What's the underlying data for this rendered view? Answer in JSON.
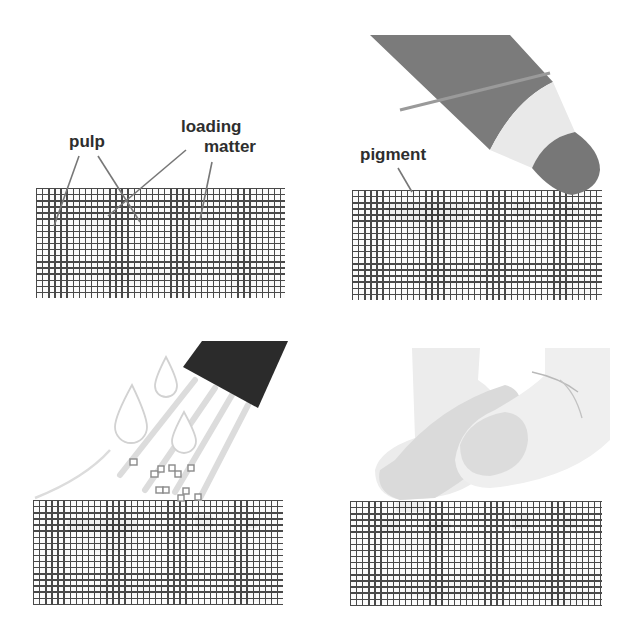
{
  "figure": {
    "type": "process-diagram",
    "panels": [
      {
        "id": "panel-1",
        "position": "top-left",
        "description": "paper cross-section with pulp fibers and loading matter",
        "labels": [
          {
            "text": "pulp"
          },
          {
            "text": "loading"
          },
          {
            "text": "matter"
          }
        ]
      },
      {
        "id": "panel-2",
        "position": "top-right",
        "description": "pigment applied to paper surface by a marker / pen tip",
        "labels": [
          {
            "text": "pigment"
          }
        ]
      },
      {
        "id": "panel-3",
        "position": "bottom-left",
        "description": "water spray from nozzle loosening particles from paper surface",
        "labels": []
      },
      {
        "id": "panel-4",
        "position": "bottom-right",
        "description": "finger pressing / rubbing the paper surface",
        "labels": []
      }
    ],
    "colors": {
      "grid_line": "#3a3a3a",
      "pulp_blob": "#c9c9c9",
      "pigment_blob": "#6d6d6d",
      "marker_body": "#7b7b7b",
      "marker_band": "#e9e9e9",
      "marker_tip": "#777777",
      "nozzle": "#2b2b2b",
      "spray": "#dcdcdc",
      "finger": "#ececec",
      "finger_shadow": "#dadada",
      "label_text": "#2e2e2e",
      "leader_line": "#777777"
    }
  }
}
